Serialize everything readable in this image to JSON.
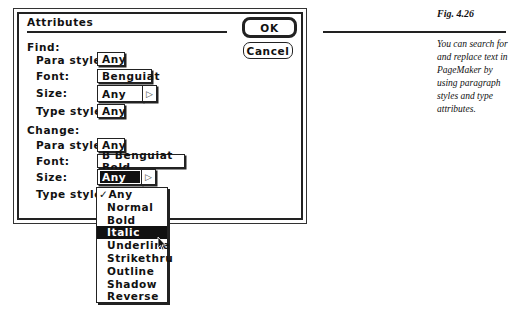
{
  "dialog": {
    "title": "Attributes",
    "ok_label": "OK",
    "cancel_label": "Cancel",
    "find": {
      "heading": "Find:",
      "para_style_label": "Para style:",
      "para_style_value": "Any",
      "font_label": "Font:",
      "font_value": "Benguiat",
      "size_label": "Size:",
      "size_value": "Any",
      "type_style_label": "Type style:",
      "type_style_value": "Any"
    },
    "change": {
      "heading": "Change:",
      "para_style_label": "Para style:",
      "para_style_value": "Any",
      "font_label": "Font:",
      "font_value": "B Benguiat Bold",
      "size_label": "Size:",
      "size_value": "Any",
      "type_style_label": "Type style:"
    },
    "type_style_menu": {
      "items": [
        {
          "label": "✓Any",
          "checked": true
        },
        {
          "label": "Normal"
        },
        {
          "label": "Bold"
        },
        {
          "label": "Italic",
          "highlighted": true
        },
        {
          "label": "Underline"
        },
        {
          "label": "Strikethru"
        },
        {
          "label": "Outline"
        },
        {
          "label": "Shadow"
        },
        {
          "label": "Reverse"
        }
      ]
    },
    "arrow_glyph": "▷"
  },
  "figure": {
    "label": "Fig. 4.26",
    "caption": "You can search for and replace text in PageMaker  by using paragraph styles and type attributes."
  }
}
